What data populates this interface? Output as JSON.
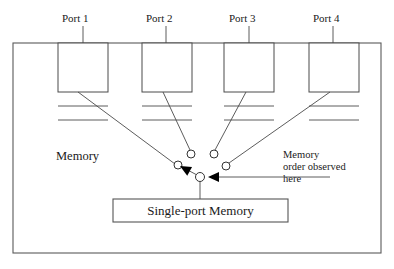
{
  "figure": {
    "outer_box": {
      "name": "memory-boundary",
      "x": 13,
      "y": 43,
      "width": 368,
      "height": 210
    },
    "memory_label": {
      "text": "Memory",
      "x": 56,
      "y": 160
    },
    "ports": [
      {
        "id": "port-1",
        "label": "Port 1",
        "label_x": 62,
        "label_y": 22,
        "stem": {
          "x": 83,
          "y1": 26,
          "y2": 43
        },
        "box": {
          "x": 58,
          "y": 43,
          "width": 50,
          "height": 49
        },
        "dividers": [
          63,
          77
        ],
        "link": {
          "x1": 78,
          "y1": 92,
          "x2": 175,
          "y2": 164
        },
        "circle": {
          "cx": 178,
          "cy": 165,
          "r": 4
        }
      },
      {
        "id": "port-2",
        "label": "Port 2",
        "label_x": 146,
        "label_y": 22,
        "stem": {
          "x": 166,
          "y1": 26,
          "y2": 43
        },
        "box": {
          "x": 142,
          "y": 43,
          "width": 50,
          "height": 49
        },
        "dividers": [
          63,
          77
        ],
        "link": {
          "x1": 163,
          "y1": 92,
          "x2": 190,
          "y2": 150
        },
        "circle": {
          "cx": 191,
          "cy": 154,
          "r": 4
        }
      },
      {
        "id": "port-3",
        "label": "Port 3",
        "label_x": 229,
        "label_y": 22,
        "stem": {
          "x": 249,
          "y1": 26,
          "y2": 43
        },
        "box": {
          "x": 224,
          "y": 43,
          "width": 50,
          "height": 49
        },
        "dividers": [
          63,
          77
        ],
        "link": {
          "x1": 246,
          "y1": 92,
          "x2": 215,
          "y2": 150
        },
        "circle": {
          "cx": 214,
          "cy": 154,
          "r": 4
        }
      },
      {
        "id": "port-4",
        "label": "Port 4",
        "label_x": 313,
        "label_y": 22,
        "stem": {
          "x": 333,
          "y1": 26,
          "y2": 43
        },
        "box": {
          "x": 309,
          "y": 43,
          "width": 50,
          "height": 49
        },
        "dividers": [
          63,
          77
        ],
        "link": {
          "x1": 330,
          "y1": 92,
          "x2": 229,
          "y2": 163
        },
        "circle": {
          "cx": 226,
          "cy": 166,
          "r": 4
        }
      }
    ],
    "junction": {
      "circle": {
        "cx": 200,
        "cy": 177,
        "r": 4.5
      },
      "link_to_port1_node": {
        "x1": 197,
        "y1": 175,
        "x2": 182,
        "y2": 167
      },
      "arrow_to_port1": {
        "tip_x": 180,
        "tip_y": 166
      },
      "stem_to_memory": {
        "x": 200,
        "y1": 182,
        "y2": 199
      }
    },
    "memory_box": {
      "label": "Single-port Memory",
      "x": 113,
      "y": 199,
      "width": 175,
      "height": 23
    },
    "annotation": {
      "lines": [
        "Memory",
        "order observed",
        "here"
      ],
      "x": 283,
      "y_start": 158,
      "line_height": 12,
      "arrow": {
        "x1": 330,
        "y1": 177,
        "x2": 212,
        "y2": 177
      },
      "arrow_tip": {
        "tip_x": 208,
        "tip_y": 177
      }
    }
  },
  "colors": {
    "line": "#3a3a3a",
    "box_stroke": "#4a4a4a",
    "outer_stroke": "#5a5a5a",
    "text": "#1a1a1a",
    "background": "#ffffff",
    "arrow_fill": "#000000"
  }
}
